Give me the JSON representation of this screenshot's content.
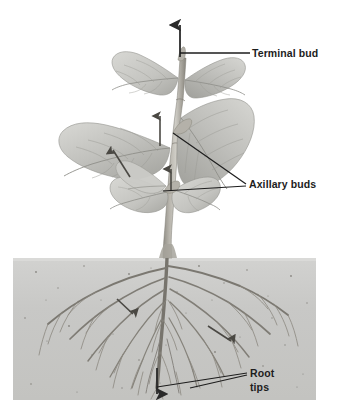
{
  "figure": {
    "background_color": "#ffffff",
    "width": 337,
    "height": 418
  },
  "soil": {
    "name": "soil-block",
    "fill_color": "#c9c9c7",
    "speckle_color": "#6e6e6c",
    "x": 13,
    "y": 258,
    "width": 303,
    "height": 142
  },
  "plant": {
    "stem_color": "#a8a49c",
    "stem_shadow_color": "#7d7a73",
    "leaf_color": "#bcbcb8",
    "leaf_vein_color": "#8d8d88",
    "root_color": "#86837c",
    "leaf_count": 8
  },
  "callouts": [
    {
      "id": "terminal-bud",
      "label": "Terminal bud",
      "label_lines": [
        "Terminal bud"
      ],
      "label_x": 252,
      "label_y": 57,
      "leader_color": "#1d1d1d",
      "arrow_direction": "up",
      "arrow_x": 180,
      "arrow_from_y": 56,
      "arrow_to_y": 25
    },
    {
      "id": "axillary-buds",
      "label": "Axillary buds",
      "label_lines": [
        "Axillary buds"
      ],
      "label_x": 249,
      "label_y": 188,
      "leader_color": "#1d1d1d",
      "target_points": [
        {
          "x": 173,
          "y": 133
        },
        {
          "x": 163,
          "y": 191
        }
      ]
    },
    {
      "id": "root-tips",
      "label": "Root tips",
      "label_lines": [
        "Root",
        "tips"
      ],
      "label_x": 250,
      "label_y": 377,
      "leader_color": "#1d1d1d",
      "arrow_direction": "down",
      "arrow_x": 157,
      "arrow_from_y": 368,
      "arrow_to_y": 393
    }
  ],
  "growth_arrows": [
    {
      "id": "stem-upper-arrow",
      "direction": "up",
      "x": 160,
      "y1": 145,
      "y2": 116
    },
    {
      "id": "stem-lower-arrow",
      "direction": "up",
      "x": 170,
      "y1": 190,
      "y2": 168
    },
    {
      "id": "leaf-left-arrow",
      "direction": "up-left",
      "x1": 128,
      "y1": 175,
      "x2": 112,
      "y2": 150
    },
    {
      "id": "root-left-arrow",
      "direction": "down-left",
      "x1": 118,
      "y1": 300,
      "x2": 131,
      "y2": 313
    },
    {
      "id": "root-right-arrow",
      "direction": "down-right",
      "x1": 210,
      "y1": 327,
      "x2": 230,
      "y2": 340
    }
  ]
}
